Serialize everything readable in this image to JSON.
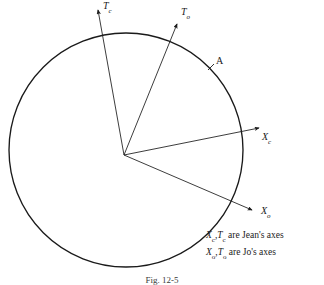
{
  "figure": {
    "caption": "Fig. 12-5",
    "background_color": "#ffffff",
    "stroke_color": "#1a1a1a"
  },
  "circle": {
    "name": "reference-circle",
    "cx": 126,
    "cy": 150,
    "r": 117
  },
  "origin": {
    "x": 124,
    "y": 155
  },
  "axes": [
    {
      "id": "Tc",
      "symbol": "T",
      "subscript": "c",
      "label": "Tc",
      "owner": "Jean",
      "tip_x": 98,
      "tip_y": 8,
      "label_x": 103,
      "label_y": 2
    },
    {
      "id": "To",
      "symbol": "T",
      "subscript": "o",
      "label": "To",
      "owner": "Jo",
      "tip_x": 177,
      "tip_y": 22,
      "label_x": 181,
      "label_y": 8
    },
    {
      "id": "Xc",
      "symbol": "X",
      "subscript": "c",
      "label": "Xc",
      "owner": "Jean",
      "tip_x": 262,
      "tip_y": 128,
      "label_x": 262,
      "label_y": 133
    },
    {
      "id": "Xo",
      "symbol": "X",
      "subscript": "o",
      "label": "Xo",
      "owner": "Jo",
      "tip_x": 254,
      "tip_y": 212,
      "label_x": 262,
      "label_y": 207
    }
  ],
  "points": [
    {
      "id": "A",
      "label": "A",
      "tick_x": 211,
      "tick_y": 67,
      "label_x": 216,
      "label_y": 57
    }
  ],
  "legend": {
    "line1": {
      "sym1": "X",
      "sub1": "c",
      "sep": ",",
      "sym2": "T",
      "sub2": "c",
      "text": " are Jean's axes"
    },
    "line2": {
      "sym1": "X",
      "sub1": "o",
      "sep": ",",
      "sym2": "T",
      "sub2": "o",
      "text": " are Jo's axes"
    }
  }
}
